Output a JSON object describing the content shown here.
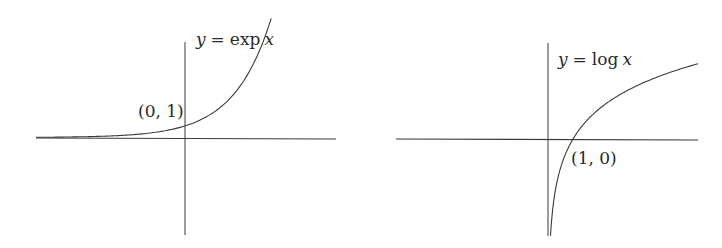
{
  "chart_data": [
    {
      "type": "line",
      "title": "",
      "function": "exp",
      "curve_label": "y = exp x",
      "curve_label_parts": {
        "y": "y",
        "eq": "=",
        "fn": "exp",
        "x": "x"
      },
      "annotations": [
        {
          "text": "(0, 1)",
          "x": 0,
          "y": 1
        }
      ],
      "x": [
        -4,
        -3,
        -2,
        -1,
        0,
        0.5,
        1,
        1.5,
        2,
        2.3
      ],
      "values": [
        0.018,
        0.05,
        0.135,
        0.368,
        1,
        1.649,
        2.718,
        4.482,
        7.389,
        9.974
      ],
      "xlabel": "",
      "ylabel": "",
      "grid": false,
      "axes": "cross through origin, no ticks"
    },
    {
      "type": "line",
      "title": "",
      "function": "log",
      "curve_label": "y = log x",
      "curve_label_parts": {
        "y": "y",
        "eq": "=",
        "fn": "log",
        "x": "x"
      },
      "annotations": [
        {
          "text": "(1, 0)",
          "x": 1,
          "y": 0
        }
      ],
      "x": [
        0.05,
        0.1,
        0.25,
        0.5,
        1,
        2,
        3,
        4,
        5,
        6
      ],
      "values": [
        -3.0,
        -2.3,
        -1.386,
        -0.693,
        0,
        0.693,
        1.099,
        1.386,
        1.609,
        1.792
      ],
      "xlabel": "",
      "ylabel": "",
      "grid": false,
      "axes": "cross through origin, no ticks"
    }
  ],
  "colors": {
    "axis": "#3a3a3a",
    "curve": "#3a3a3a",
    "background": "#ffffff"
  }
}
